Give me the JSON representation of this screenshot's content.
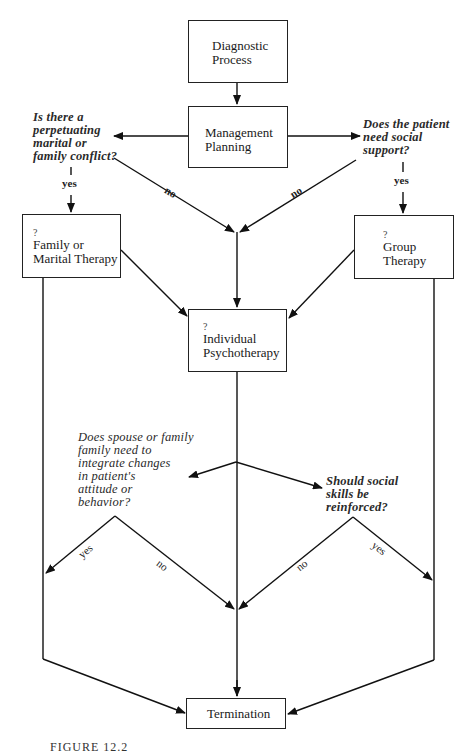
{
  "nodes": {
    "diagnostic": {
      "label_line1": "Diagnostic",
      "label_line2": "Process"
    },
    "management": {
      "label_line1": "Management",
      "label_line2": "Planning"
    },
    "family": {
      "marker": "?",
      "label_line1": "Family or",
      "label_line2": "Marital Therapy"
    },
    "group": {
      "marker": "?",
      "label_line1": "Group",
      "label_line2": "Therapy"
    },
    "individual": {
      "marker": "?",
      "label_line1": "Individual",
      "label_line2": "Psychotherapy"
    },
    "termination": {
      "label": "Termination"
    }
  },
  "questions": {
    "q1": {
      "lines": [
        "Is there a",
        "perpetuating",
        "marital or",
        "family conflict?"
      ]
    },
    "q2": {
      "lines": [
        "Does the patient",
        "need social",
        "support?"
      ]
    },
    "q3": {
      "lines": [
        "Does spouse or family",
        "family need to",
        "integrate changes",
        "in patient's",
        "attitude or",
        "behavior?"
      ]
    },
    "q4": {
      "lines": [
        "Should social",
        "skills be",
        "reinforced?"
      ]
    }
  },
  "edge_labels": {
    "q1_yes": "yes",
    "q2_yes": "yes",
    "q1_no": "no",
    "q2_no": "no",
    "q3_yes": "yes",
    "q3_no": "no",
    "q4_no": "no",
    "q4_yes": "yes"
  },
  "caption": "FIGURE 12.2"
}
